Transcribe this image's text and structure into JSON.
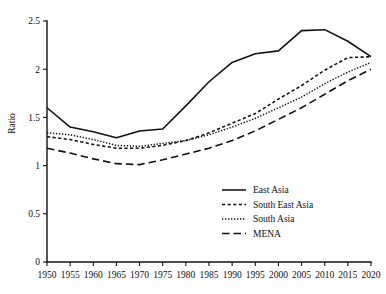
{
  "chart_data": {
    "type": "line",
    "title": "",
    "subtitle": "",
    "xlabel": "",
    "ylabel": "Ratio",
    "xlim": [
      1950,
      2020
    ],
    "ylim": [
      0,
      2.5
    ],
    "grid": false,
    "legend_position": "center-right-lower",
    "x": [
      1950,
      1955,
      1960,
      1965,
      1970,
      1975,
      1980,
      1985,
      1990,
      1995,
      2000,
      2005,
      2010,
      2015,
      2020
    ],
    "xticklabels": [
      "1950",
      "1955",
      "1960",
      "1965",
      "1970",
      "1975",
      "1980",
      "1985",
      "1990",
      "1995",
      "2000",
      "2005",
      "2010",
      "2015",
      "2020"
    ],
    "yticks": [
      0,
      0.5,
      1,
      1.5,
      2,
      2.5
    ],
    "yticklabels": [
      "0",
      "0.5",
      "1",
      "1.5",
      "2",
      "2.5"
    ],
    "series": [
      {
        "name": "East Asia",
        "style": "solid",
        "color": "#111111",
        "values": [
          1.6,
          1.4,
          1.35,
          1.29,
          1.36,
          1.38,
          1.62,
          1.87,
          2.07,
          2.16,
          2.19,
          2.4,
          2.41,
          2.29,
          2.13
        ]
      },
      {
        "name": "South East Asia",
        "style": "dashed",
        "color": "#111111",
        "values": [
          1.3,
          1.27,
          1.22,
          1.18,
          1.18,
          1.21,
          1.26,
          1.34,
          1.44,
          1.54,
          1.69,
          1.83,
          1.99,
          2.12,
          2.13
        ]
      },
      {
        "name": "South Asia",
        "style": "dotted",
        "color": "#111111",
        "values": [
          1.34,
          1.32,
          1.27,
          1.21,
          1.2,
          1.23,
          1.26,
          1.32,
          1.4,
          1.49,
          1.6,
          1.71,
          1.85,
          1.97,
          2.07
        ]
      },
      {
        "name": "MENA",
        "style": "longdash",
        "color": "#111111",
        "values": [
          1.18,
          1.13,
          1.07,
          1.02,
          1.01,
          1.06,
          1.12,
          1.18,
          1.26,
          1.36,
          1.48,
          1.6,
          1.74,
          1.88,
          2.0
        ]
      }
    ]
  },
  "legend": {
    "items": [
      {
        "label": "East Asia",
        "style": "solid"
      },
      {
        "label": "South East Asia",
        "style": "dashed"
      },
      {
        "label": "South Asia",
        "style": "dotted"
      },
      {
        "label": "MENA",
        "style": "longdash"
      }
    ]
  },
  "axes": {
    "y_title": "Ratio"
  }
}
